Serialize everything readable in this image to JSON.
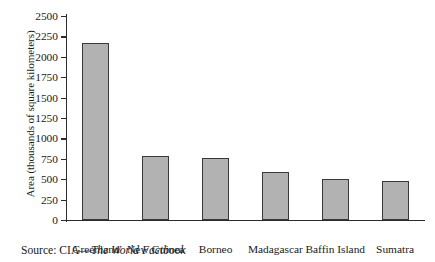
{
  "chart_data": {
    "type": "bar",
    "title": "",
    "subtitle": "",
    "xlabel": "",
    "ylabel": "Area (thousands of square kilometers)",
    "categories": [
      "Greenland",
      "New Guinea",
      "Borneo",
      "Madagascar",
      "Baffin Island",
      "Sumatra"
    ],
    "values": [
      2166,
      786,
      760,
      587,
      507,
      473
    ],
    "series": [
      {
        "name": "Area",
        "values": [
          2166,
          786,
          760,
          587,
          507,
          473
        ]
      }
    ],
    "ylim": [
      0,
      2500
    ],
    "ytick_step": 250,
    "yticks": [
      0,
      250,
      500,
      750,
      1000,
      1250,
      1500,
      1750,
      2000,
      2250,
      2500
    ],
    "ytick_labels": [
      "0",
      "250",
      "500",
      "750",
      "1000",
      "1250",
      "1500",
      "1750",
      "2000",
      "2250",
      "2500"
    ],
    "grid": false,
    "legend": false,
    "legend_position": "none",
    "bar_color": "#b2b2b2",
    "bar_edge_color": "#3a3a3a",
    "axis_color": "#2b2b2b",
    "background_color": "#ffffff",
    "tick_direction": "out",
    "spines": [
      "left",
      "bottom"
    ]
  },
  "caption": {
    "prefix": "Source: CIA—",
    "book_title": "The World Factbook"
  }
}
